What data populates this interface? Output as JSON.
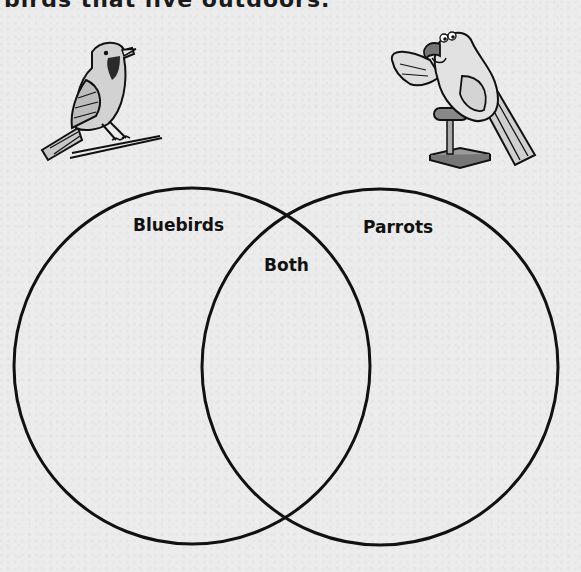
{
  "page": {
    "top_text": "birds that live outdoors."
  },
  "illustrations": {
    "left": {
      "subject": "bluebird",
      "icon": "bluebird-on-branch-icon"
    },
    "right": {
      "subject": "parrot",
      "icon": "parrot-on-perch-icon"
    }
  },
  "venn": {
    "left_label": "Bluebirds",
    "right_label": "Parrots",
    "overlap_label": "Both",
    "colors": {
      "stroke": "#111111",
      "background": "#ececec"
    }
  }
}
